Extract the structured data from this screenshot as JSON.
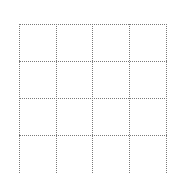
{
  "grid": {
    "columns": 4,
    "rows": 4,
    "line_color": "#7a7a7a",
    "line_style": "dotted",
    "cells": [
      [
        "",
        "",
        "",
        ""
      ],
      [
        "",
        "",
        "",
        ""
      ],
      [
        "",
        "",
        "",
        ""
      ],
      [
        "",
        "",
        "",
        ""
      ]
    ]
  }
}
